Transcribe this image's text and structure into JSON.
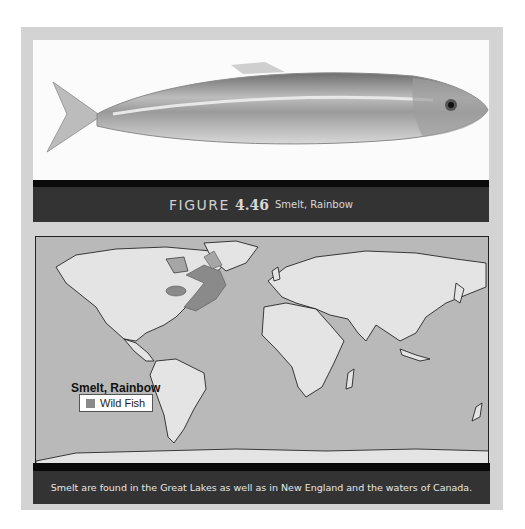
{
  "figure": {
    "label": "FIGURE",
    "number": "4.46",
    "name": "Smelt, Rainbow"
  },
  "photo": {
    "subject": "rainbow-smelt-fish"
  },
  "map": {
    "title": "Smelt, Rainbow",
    "legend": [
      {
        "label": "Wild Fish",
        "color": "#8a8a8a"
      }
    ],
    "ocean_color": "#b9b9b9",
    "land_color": "#e4e4e4",
    "highlight_regions": [
      "Great Lakes",
      "New England",
      "Canada coastal waters"
    ]
  },
  "caption": "Smelt are found in the Great Lakes as well as in New England and the waters of Canada."
}
